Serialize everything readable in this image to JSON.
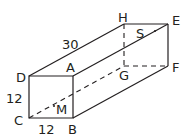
{
  "diagram": {
    "type": "rectangular-prism",
    "vertices": {
      "A": {
        "label": "A",
        "x": 73,
        "y": 76
      },
      "B": {
        "label": "B",
        "x": 73,
        "y": 118
      },
      "C": {
        "label": "C",
        "x": 29,
        "y": 118
      },
      "D": {
        "label": "D",
        "x": 29,
        "y": 76
      },
      "E": {
        "label": "E",
        "x": 168,
        "y": 24
      },
      "F": {
        "label": "F",
        "x": 168,
        "y": 66
      },
      "G": {
        "label": "G",
        "x": 124,
        "y": 66
      },
      "H": {
        "label": "H",
        "x": 124,
        "y": 24
      }
    },
    "points": {
      "M": {
        "label": "M"
      },
      "S": {
        "label": "S"
      }
    },
    "dimensions": {
      "length": "30",
      "height": "12",
      "width": "12"
    }
  }
}
